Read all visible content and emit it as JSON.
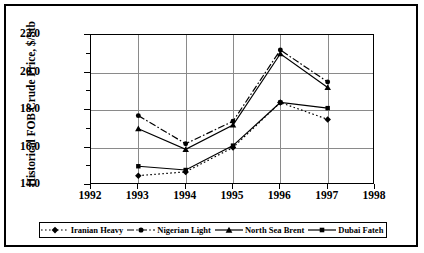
{
  "axes": {
    "ylabel": "Historical FOB Crude Price, $/Stb",
    "yticks": [
      "14.0",
      "16.0",
      "18.0",
      "20.0",
      "22.0"
    ],
    "xticks": [
      "1992",
      "1993",
      "1994",
      "1995",
      "1996",
      "1997",
      "1998"
    ]
  },
  "legend": {
    "items": [
      {
        "label": "Iranian Heavy",
        "marker": "diamond-marker",
        "line": "dotted"
      },
      {
        "label": "Nigerian Light",
        "marker": "circle-marker",
        "line": "dash-dot"
      },
      {
        "label": "North Sea Brent",
        "marker": "triangle-marker",
        "line": "solid"
      },
      {
        "label": "Dubai Fateh",
        "marker": "square-marker",
        "line": "solid"
      }
    ]
  },
  "chart_data": {
    "type": "line",
    "title": "",
    "xlabel": "",
    "ylabel": "Historical FOB Crude Price, $/Stb",
    "x": [
      1993,
      1994,
      1995,
      1996,
      1997
    ],
    "xlim": [
      1992,
      1998
    ],
    "ylim": [
      14.0,
      22.0
    ],
    "grid": true,
    "legend_position": "bottom",
    "series": [
      {
        "name": "Iranian Heavy",
        "marker": "diamond",
        "line": "dotted",
        "values": [
          14.5,
          14.7,
          16.0,
          18.4,
          17.5
        ]
      },
      {
        "name": "Nigerian Light",
        "marker": "circle",
        "line": "dash-dot",
        "values": [
          17.7,
          16.2,
          17.4,
          21.2,
          19.5
        ]
      },
      {
        "name": "North Sea Brent",
        "marker": "triangle",
        "line": "solid",
        "values": [
          17.0,
          15.9,
          17.2,
          21.0,
          19.2
        ]
      },
      {
        "name": "Dubai Fateh",
        "marker": "square",
        "line": "solid",
        "values": [
          15.0,
          14.8,
          16.1,
          18.4,
          18.1
        ]
      }
    ]
  }
}
